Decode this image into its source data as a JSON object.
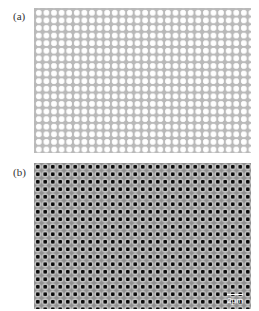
{
  "figure": {
    "panels": [
      {
        "label": "(a)",
        "description": "Simulated square lattice of circular holes (light dots on gray)"
      },
      {
        "label": "(b)",
        "description": "SEM micrograph of fabricated hole array",
        "scale_bar": "2μm"
      }
    ]
  }
}
